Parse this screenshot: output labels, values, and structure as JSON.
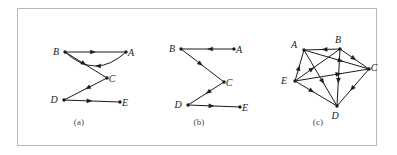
{
  "figure": {
    "background_color": "#ffffff",
    "frame_color": "#b9b9b9",
    "edge_color": "#1b1b1b",
    "node_color": "#1b1b1b",
    "label_color": "#1b1b1b"
  },
  "panels": [
    {
      "id": "a",
      "caption": "(a)",
      "nodes": [
        {
          "id": "B",
          "label": "B",
          "x": 47,
          "y": 43,
          "label_dx": -9,
          "label_dy": 3
        },
        {
          "id": "A",
          "label": "A",
          "x": 108,
          "y": 43,
          "label_dx": 5,
          "label_dy": 4
        },
        {
          "id": "C",
          "label": "C",
          "x": 89,
          "y": 69,
          "label_dx": 5,
          "label_dy": 4
        },
        {
          "id": "D",
          "label": "D",
          "x": 46,
          "y": 91,
          "label_dx": -10,
          "label_dy": 3
        },
        {
          "id": "E",
          "label": "E",
          "x": 102,
          "y": 93,
          "label_dx": 5,
          "label_dy": 4
        }
      ],
      "edges": [
        {
          "from": "A",
          "to": "B",
          "kind": "curve",
          "bow": -14,
          "arrow_at": 0.5
        },
        {
          "from": "B",
          "to": "A",
          "kind": "line",
          "arrow_at": 0.5
        },
        {
          "from": "B",
          "to": "C",
          "kind": "line",
          "arrow_at": 0.5
        },
        {
          "from": "C",
          "to": "D",
          "kind": "line",
          "arrow_at": 0.5
        },
        {
          "from": "D",
          "to": "E",
          "kind": "line",
          "arrow_at": 0.5
        }
      ]
    },
    {
      "id": "b",
      "caption": "(b)",
      "nodes": [
        {
          "id": "B",
          "label": "B",
          "x": 41,
          "y": 40,
          "label_dx": -9,
          "label_dy": 3
        },
        {
          "id": "A",
          "label": "A",
          "x": 94,
          "y": 40,
          "label_dx": 5,
          "label_dy": 4
        },
        {
          "id": "C",
          "label": "C",
          "x": 84,
          "y": 73,
          "label_dx": 5,
          "label_dy": 4
        },
        {
          "id": "D",
          "label": "D",
          "x": 48,
          "y": 96,
          "label_dx": -10,
          "label_dy": 3
        },
        {
          "id": "E",
          "label": "E",
          "x": 100,
          "y": 98,
          "label_dx": 5,
          "label_dy": 4
        }
      ],
      "edges": [
        {
          "from": "A",
          "to": "B",
          "kind": "line",
          "arrow_at": 0.5
        },
        {
          "from": "B",
          "to": "C",
          "kind": "line",
          "arrow_at": 0.5
        },
        {
          "from": "C",
          "to": "D",
          "kind": "line",
          "arrow_at": 0.5
        },
        {
          "from": "D",
          "to": "E",
          "kind": "line",
          "arrow_at": 0.5
        }
      ]
    },
    {
      "id": "c",
      "caption": "(c)",
      "nodes": [
        {
          "id": "A",
          "label": "A",
          "x": 46,
          "y": 41,
          "label_dx": -10,
          "label_dy": -2
        },
        {
          "id": "B",
          "label": "B",
          "x": 82,
          "y": 40,
          "label_dx": -2,
          "label_dy": -6
        },
        {
          "id": "C",
          "label": "C",
          "x": 111,
          "y": 60,
          "label_dx": 5,
          "label_dy": 2
        },
        {
          "id": "D",
          "label": "D",
          "x": 79,
          "y": 97,
          "label_dx": -2,
          "label_dy": 13
        },
        {
          "id": "E",
          "label": "E",
          "x": 37,
          "y": 72,
          "label_dx": -11,
          "label_dy": 3
        }
      ],
      "edges": [
        {
          "from": "B",
          "to": "A",
          "kind": "line",
          "arrow_at": 0.5
        },
        {
          "from": "B",
          "to": "C",
          "kind": "line",
          "arrow_at": 0.55
        },
        {
          "from": "A",
          "to": "C",
          "kind": "line",
          "arrow_at": 0.6
        },
        {
          "from": "E",
          "to": "C",
          "kind": "line",
          "arrow_at": 0.62
        },
        {
          "from": "E",
          "to": "A",
          "kind": "line",
          "arrow_at": 0.5
        },
        {
          "from": "E",
          "to": "B",
          "kind": "line",
          "arrow_at": 0.42
        },
        {
          "from": "E",
          "to": "D",
          "kind": "line",
          "arrow_at": 0.45
        },
        {
          "from": "A",
          "to": "D",
          "kind": "line",
          "arrow_at": 0.6
        },
        {
          "from": "B",
          "to": "D",
          "kind": "line",
          "arrow_at": 0.6
        },
        {
          "from": "C",
          "to": "D",
          "kind": "line",
          "arrow_at": 0.58
        }
      ]
    }
  ]
}
